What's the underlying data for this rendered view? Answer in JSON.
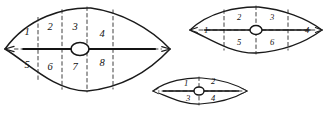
{
  "figure": {
    "background_color": "#ffffff",
    "ink_color": "#1a1a1a",
    "dash_color": "#2a2a2a"
  },
  "shapes": [
    {
      "id": "large-cell",
      "name": "large-lens-cell",
      "geometry": {
        "left_tip_x": 5,
        "right_tip_x": 170,
        "center_x": 87,
        "center_y": 49,
        "top_y": 8,
        "bottom_y": 91,
        "nucleus_cx": 80,
        "nucleus_cy": 49,
        "nucleus_rx": 9,
        "nucleus_ry": 6.5
      },
      "dashed_verticals": [
        38,
        62,
        87,
        113
      ],
      "labels": [
        {
          "text": "1",
          "x": 27,
          "y": 33
        },
        {
          "text": "2",
          "x": 50,
          "y": 28
        },
        {
          "text": "3",
          "x": 75,
          "y": 28
        },
        {
          "text": "4",
          "x": 102,
          "y": 35
        },
        {
          "text": "5",
          "x": 27,
          "y": 66
        },
        {
          "text": "6",
          "x": 50,
          "y": 68
        },
        {
          "text": "7",
          "x": 75,
          "y": 68
        },
        {
          "text": "8",
          "x": 102,
          "y": 64
        }
      ]
    },
    {
      "id": "medium-cell",
      "name": "medium-lens-cell",
      "geometry": {
        "left_tip_x": 190,
        "right_tip_x": 322,
        "center_x": 256,
        "center_y": 30,
        "top_y": 7,
        "bottom_y": 53,
        "nucleus_cx": 256,
        "nucleus_cy": 30,
        "nucleus_rx": 6,
        "nucleus_ry": 4.5
      },
      "dashed_verticals": [
        224,
        256,
        288
      ],
      "labels": [
        {
          "text": "1",
          "x": 206,
          "y": 31
        },
        {
          "text": "2",
          "x": 239,
          "y": 18
        },
        {
          "text": "3",
          "x": 272,
          "y": 18
        },
        {
          "text": "4",
          "x": 307,
          "y": 31
        },
        {
          "text": "5",
          "x": 239,
          "y": 43
        },
        {
          "text": "6",
          "x": 272,
          "y": 43
        }
      ]
    },
    {
      "id": "small-cell",
      "name": "small-lens-cell",
      "geometry": {
        "left_tip_x": 153,
        "right_tip_x": 247,
        "center_x": 200,
        "center_y": 91,
        "top_y": 78,
        "bottom_y": 104,
        "nucleus_cx": 199,
        "nucleus_cy": 91,
        "nucleus_rx": 5,
        "nucleus_ry": 4
      },
      "dashed_verticals": [
        199
      ],
      "labels": [
        {
          "text": "1",
          "x": 186,
          "y": 84
        },
        {
          "text": "2",
          "x": 213,
          "y": 82
        },
        {
          "text": "3",
          "x": 188,
          "y": 99
        },
        {
          "text": "4",
          "x": 213,
          "y": 99
        }
      ]
    }
  ]
}
